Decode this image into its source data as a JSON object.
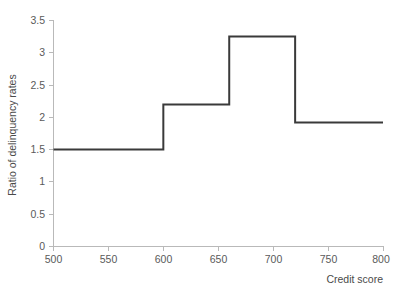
{
  "chart_data": {
    "type": "line",
    "subtype": "step",
    "title": "",
    "xlabel": "Credit score",
    "ylabel": "Ratio of delinquency rates",
    "xlim": [
      500,
      800
    ],
    "ylim": [
      0,
      3.5
    ],
    "xticks": [
      500,
      550,
      600,
      650,
      700,
      750,
      800
    ],
    "xtick_labels": [
      "500",
      "550",
      "600",
      "650",
      "700",
      "750",
      "800"
    ],
    "yticks": [
      0,
      0.5,
      1,
      1.5,
      2,
      2.5,
      3,
      3.5
    ],
    "ytick_labels": [
      "0",
      "0.5",
      "1",
      "1.5",
      "2",
      "2.5",
      "3",
      "3.5"
    ],
    "grid": false,
    "legend": null,
    "line_color": "#3a3a3a",
    "axis_color": "#b9b9b9",
    "background_color": "#ffffff",
    "series": [
      {
        "name": "Ratio of delinquency rates",
        "step_segments": [
          {
            "x_start": 500,
            "x_end": 600,
            "value": 1.5
          },
          {
            "x_start": 600,
            "x_end": 660,
            "value": 2.2
          },
          {
            "x_start": 660,
            "x_end": 720,
            "value": 3.25
          },
          {
            "x_start": 720,
            "x_end": 800,
            "value": 1.92
          }
        ],
        "x": [
          500,
          600,
          600,
          660,
          660,
          720,
          720,
          800
        ],
        "values": [
          1.5,
          1.5,
          2.2,
          2.2,
          3.25,
          3.25,
          1.92,
          1.92
        ]
      }
    ]
  }
}
